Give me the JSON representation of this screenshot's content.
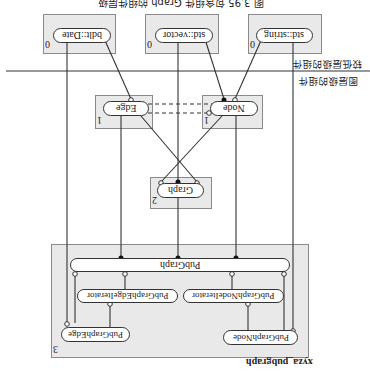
{
  "figure": {
    "caption": "图 3.95 包含组件 Graph 的组件层级",
    "orientation": "rotated-180",
    "separator_labels": {
      "above": "较低层级的组件",
      "below": "图层级的组件"
    }
  },
  "components": {
    "std_string": {
      "label": "std::string",
      "level": "0"
    },
    "std_vector": {
      "label": "std::vector",
      "level": "0"
    },
    "bdlt_date": {
      "label": "bdlt::Date",
      "level": "0"
    },
    "node": {
      "label": "Node",
      "level": "1"
    },
    "edge": {
      "label": "Edge",
      "level": "1"
    },
    "graph": {
      "label": "Graph",
      "level": "2"
    }
  },
  "package": {
    "name": "xyza_pubgraph",
    "level": "3",
    "pubgraph": "PubGraph",
    "node_iterator": "PubGraphNodeIterator",
    "edge_iterator": "PubGraphEdgeIterator",
    "node": "PubGraphNode",
    "edge": "PubGraphEdge"
  },
  "colors": {
    "box_fill": "#e9e9e9",
    "box_border": "#8a8a8a",
    "line": "#333333"
  }
}
